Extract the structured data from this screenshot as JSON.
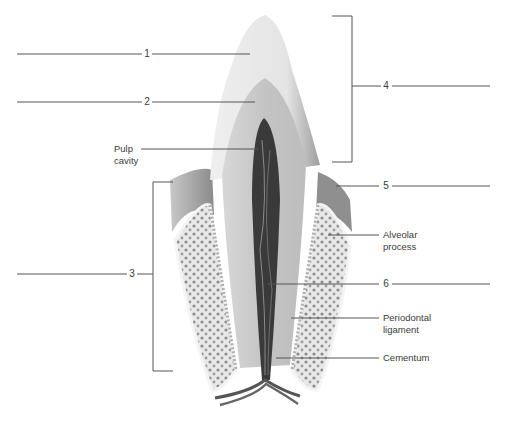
{
  "figure": {
    "numbered_labels": [
      {
        "id": "1",
        "text": "1"
      },
      {
        "id": "2",
        "text": "2"
      },
      {
        "id": "3",
        "text": "3"
      },
      {
        "id": "4",
        "text": "4"
      },
      {
        "id": "5",
        "text": "5"
      },
      {
        "id": "6",
        "text": "6"
      }
    ],
    "named_labels": {
      "pulp_cavity": {
        "line1": "Pulp",
        "line2": "cavity"
      },
      "alveolar_process": {
        "line1": "Alveolar",
        "line2": "process"
      },
      "periodontal_ligament": {
        "line1": "Periodontal",
        "line2": "ligament"
      },
      "cementum": {
        "line1": "Cementum"
      }
    },
    "colors": {
      "line": "#555555",
      "enamel": "#f2f2f2",
      "dentin": "#cfcfcf",
      "pulp": "#3a3a3a",
      "gum": "#9a9a9a",
      "bone": "#e6e6e6"
    }
  }
}
